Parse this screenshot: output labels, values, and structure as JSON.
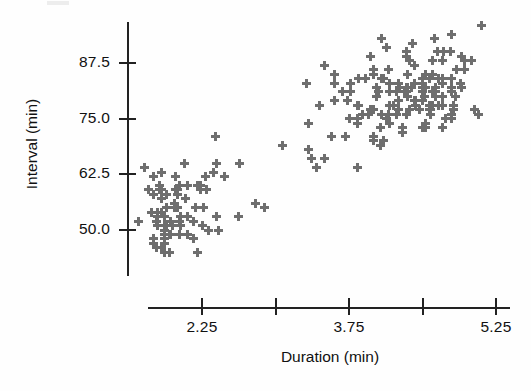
{
  "chart_data": {
    "type": "scatter",
    "title": "",
    "xlabel": "Duration (min)",
    "ylabel": "Interval (min)",
    "xlim": [
      1.55,
      5.55
    ],
    "ylim": [
      41.0,
      97.0
    ],
    "xticks": [
      2.25,
      3.0,
      3.75,
      4.5,
      5.25
    ],
    "xtick_labels": [
      "2.25",
      "",
      "3.75",
      "",
      "5.25"
    ],
    "yticks": [
      50.0,
      62.5,
      75.0,
      87.5
    ],
    "ytick_labels": [
      "50.0",
      "62.5",
      "75.0",
      "87.5"
    ],
    "grid": false,
    "legend": null,
    "marker": "plus",
    "marker_color": "#6e6e6e",
    "axis_color": "#222222",
    "n_points": 222,
    "series": [
      {
        "name": "Old Faithful eruptions",
        "x": [
          3.6,
          1.8,
          3.333,
          2.283,
          4.533,
          2.883,
          4.7,
          3.6,
          1.95,
          4.35,
          1.833,
          3.917,
          4.2,
          1.75,
          4.7,
          2.167,
          1.75,
          4.8,
          1.6,
          4.25,
          1.8,
          1.75,
          3.45,
          3.067,
          4.533,
          3.6,
          1.967,
          4.083,
          3.85,
          4.433,
          4.3,
          4.467,
          3.367,
          4.033,
          3.833,
          2.017,
          1.867,
          4.833,
          1.833,
          4.783,
          4.35,
          1.883,
          4.567,
          1.75,
          4.533,
          3.317,
          3.833,
          2.1,
          4.633,
          2.0,
          4.8,
          4.716,
          1.833,
          4.833,
          1.733,
          4.883,
          3.717,
          1.667,
          4.567,
          4.317,
          2.233,
          4.5,
          1.75,
          4.8,
          1.817,
          4.4,
          4.167,
          4.7,
          2.067,
          4.7,
          4.033,
          1.967,
          4.5,
          4.0,
          1.983,
          5.067,
          2.017,
          4.567,
          3.883,
          3.6,
          4.133,
          4.333,
          4.1,
          2.633,
          4.067,
          4.933,
          3.95,
          4.517,
          2.167,
          4.0,
          2.2,
          4.333,
          1.867,
          4.817,
          1.833,
          4.3,
          4.667,
          3.75,
          1.867,
          4.9,
          2.483,
          4.367,
          2.1,
          4.5,
          4.05,
          1.867,
          4.7,
          1.783,
          4.85,
          3.683,
          4.733,
          2.3,
          4.9,
          4.417,
          1.7,
          4.633,
          2.317,
          4.6,
          1.817,
          4.417,
          2.617,
          4.067,
          4.25,
          1.967,
          4.6,
          3.767,
          1.917,
          4.5,
          2.267,
          4.65,
          1.867,
          4.167,
          2.8,
          4.333,
          1.833,
          4.383,
          1.883,
          4.933,
          2.033,
          3.733,
          4.233,
          2.233,
          4.533,
          4.817,
          4.333,
          1.983,
          4.633,
          2.017,
          5.1,
          1.8,
          5.033,
          4.0,
          2.4,
          4.6,
          3.567,
          4.0,
          4.5,
          4.083,
          1.8,
          3.967,
          2.2,
          4.15,
          2.0,
          3.833,
          3.5,
          4.583,
          2.367,
          5.0,
          1.933,
          4.617,
          1.917,
          2.083,
          4.583,
          3.333,
          4.167,
          4.333,
          4.5,
          2.417,
          4.0,
          4.167,
          1.883,
          4.583,
          4.25,
          3.767,
          2.033,
          4.433,
          4.083,
          1.833,
          4.417,
          2.183,
          4.8,
          1.833,
          4.8,
          4.1,
          3.966,
          4.233,
          3.5,
          4.366,
          2.25,
          4.667,
          2.1,
          4.35,
          4.133,
          1.867,
          4.6,
          1.783,
          4.367,
          3.85,
          1.933,
          4.5,
          2.383,
          4.7,
          1.867,
          3.833,
          3.417,
          4.233,
          2.4,
          4.8,
          2.0,
          4.15,
          1.867,
          4.267
        ],
        "y": [
          79,
          54,
          74,
          62,
          85,
          55,
          88,
          85,
          51,
          85,
          54,
          84,
          78,
          47,
          83,
          52,
          62,
          84,
          52,
          79,
          51,
          47,
          78,
          69,
          74,
          83,
          55,
          76,
          78,
          79,
          73,
          77,
          66,
          80,
          74,
          52,
          48,
          80,
          59,
          90,
          80,
          58,
          84,
          58,
          73,
          83,
          64,
          53,
          82,
          59,
          75,
          90,
          54,
          80,
          54,
          83,
          71,
          64,
          77,
          81,
          59,
          84,
          48,
          82,
          60,
          92,
          78,
          78,
          65,
          73,
          82,
          56,
          79,
          71,
          62,
          76,
          60,
          78,
          76,
          83,
          75,
          82,
          70,
          65,
          73,
          88,
          76,
          80,
          48,
          86,
          60,
          90,
          50,
          78,
          63,
          72,
          84,
          75,
          51,
          82,
          62,
          88,
          49,
          83,
          81,
          47,
          84,
          52,
          86,
          81,
          75,
          59,
          89,
          79,
          59,
          81,
          50,
          85,
          59,
          87,
          53,
          69,
          77,
          56,
          88,
          81,
          45,
          82,
          55,
          90,
          45,
          83,
          56,
          89,
          46,
          82,
          51,
          86,
          53,
          79,
          81,
          60,
          82,
          77,
          76,
          59,
          80,
          49,
          96,
          53,
          77,
          77,
          65,
          81,
          71,
          70,
          81,
          93,
          53,
          89,
          45,
          86,
          58,
          78,
          66,
          76,
          63,
          88,
          52,
          93,
          49,
          57,
          77,
          68,
          81,
          81,
          73,
          50,
          85,
          74,
          55,
          77,
          83,
          83,
          51,
          78,
          84,
          46,
          83,
          55,
          81,
          57,
          76,
          84,
          77,
          81,
          87,
          77,
          51,
          78,
          60,
          82,
          91,
          53,
          78,
          46,
          77,
          84,
          49,
          83,
          71,
          80,
          49,
          75,
          64,
          76,
          53,
          94,
          55,
          76,
          50,
          82
        ]
      }
    ]
  },
  "axis_labels": {
    "x_title": "Duration (min)",
    "y_title": "Interval (min)"
  }
}
